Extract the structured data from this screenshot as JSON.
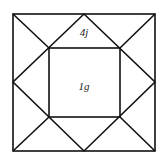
{
  "diagram": {
    "labels": {
      "top_triangle": "4j",
      "center_square": "1g"
    },
    "stroke_color": "#111111",
    "background_color": "#ffffff"
  }
}
